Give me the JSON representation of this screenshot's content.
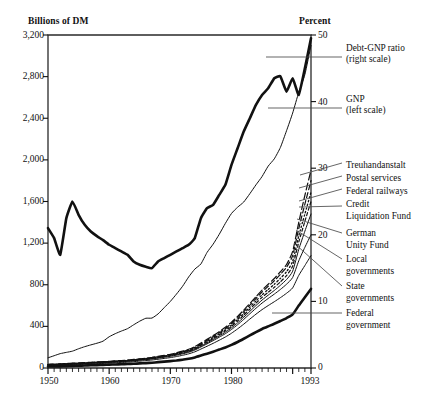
{
  "chart_data": {
    "type": "line",
    "title": "",
    "ylabel": "Billions of DM",
    "ylabel_right": "Percent",
    "xlabel": "",
    "xlim": [
      1950,
      1993
    ],
    "ylim": [
      0,
      3200
    ],
    "ylim_right": [
      0,
      50
    ],
    "grid": false,
    "legend_position": "right",
    "y_ticks": [
      "0",
      "400",
      "800",
      "1,200",
      "1,600",
      "2,000",
      "2,400",
      "2,800",
      "3,200"
    ],
    "y_tick_values": [
      0,
      400,
      800,
      1200,
      1600,
      2000,
      2400,
      2800,
      3200
    ],
    "y_ticks_right": [
      "0",
      "10",
      "20",
      "30",
      "40",
      "50"
    ],
    "y_tick_values_right": [
      0,
      10,
      20,
      30,
      40,
      50
    ],
    "x_ticks": [
      "1950",
      "1960",
      "1970",
      "1980",
      "1993"
    ],
    "x_tick_values": [
      1950,
      1960,
      1970,
      1980,
      1993
    ],
    "x_minor_tick_interval": 1,
    "x": [
      1950,
      1951,
      1952,
      1953,
      1954,
      1955,
      1956,
      1957,
      1958,
      1959,
      1960,
      1961,
      1962,
      1963,
      1964,
      1965,
      1966,
      1967,
      1968,
      1969,
      1970,
      1971,
      1972,
      1973,
      1974,
      1975,
      1976,
      1977,
      1978,
      1979,
      1980,
      1981,
      1982,
      1983,
      1984,
      1985,
      1986,
      1987,
      1988,
      1989,
      1990,
      1991,
      1992,
      1993
    ],
    "series": [
      {
        "name": "Debt-GNP ratio (right scale)",
        "axis": "right",
        "units": "percent",
        "style": "solid-thick",
        "values": [
          21.0,
          19.5,
          17.0,
          22.5,
          25.0,
          23.0,
          21.5,
          20.5,
          19.8,
          19.2,
          18.5,
          18.0,
          17.5,
          17.0,
          16.0,
          15.5,
          15.2,
          15.0,
          16.0,
          16.5,
          17.0,
          17.5,
          18.0,
          18.5,
          19.5,
          22.5,
          24.0,
          24.5,
          26.0,
          27.5,
          30.5,
          33.0,
          35.5,
          37.5,
          39.5,
          41.0,
          42.0,
          43.5,
          43.8,
          41.5,
          43.5,
          41.0,
          45.0,
          49.5
        ]
      },
      {
        "name": "GNP (left scale)",
        "axis": "left",
        "units": "billions_dm",
        "style": "solid-thin",
        "values": [
          98,
          118,
          138,
          150,
          162,
          185,
          205,
          222,
          238,
          258,
          300,
          330,
          355,
          378,
          415,
          450,
          478,
          480,
          520,
          580,
          640,
          710,
          785,
          875,
          950,
          1000,
          1110,
          1190,
          1285,
          1390,
          1485,
          1545,
          1595,
          1675,
          1760,
          1840,
          1940,
          2010,
          2120,
          2280,
          2450,
          2650,
          2820,
          3100
        ]
      },
      {
        "name": "Treuhandanstalt",
        "axis": "left",
        "units": "billions_dm",
        "style": "dashed-long",
        "values": [
          35,
          38,
          40,
          43,
          46,
          49,
          52,
          55,
          58,
          61,
          64,
          68,
          72,
          76,
          82,
          88,
          94,
          102,
          112,
          122,
          132,
          146,
          162,
          180,
          205,
          240,
          275,
          312,
          350,
          392,
          440,
          496,
          556,
          620,
          685,
          748,
          805,
          860,
          925,
          995,
          1120,
          1400,
          1660,
          1900
        ]
      },
      {
        "name": "Postal services",
        "axis": "left",
        "units": "billions_dm",
        "style": "dashed-medium",
        "values": [
          33,
          36,
          38,
          41,
          44,
          47,
          50,
          53,
          56,
          59,
          62,
          66,
          70,
          74,
          79,
          85,
          91,
          99,
          108,
          118,
          128,
          141,
          157,
          174,
          198,
          232,
          266,
          302,
          339,
          380,
          427,
          482,
          541,
          604,
          668,
          730,
          785,
          838,
          900,
          968,
          1080,
          1340,
          1575,
          1800
        ]
      },
      {
        "name": "Federal railways",
        "axis": "left",
        "units": "billions_dm",
        "style": "dotted",
        "values": [
          31,
          34,
          36,
          39,
          42,
          45,
          48,
          51,
          54,
          57,
          60,
          64,
          68,
          72,
          77,
          83,
          89,
          96,
          105,
          115,
          125,
          137,
          152,
          169,
          192,
          225,
          258,
          293,
          329,
          368,
          413,
          466,
          523,
          584,
          645,
          703,
          755,
          805,
          862,
          925,
          1025,
          1270,
          1480,
          1690
        ]
      },
      {
        "name": "Credit Liquidation Fund",
        "axis": "left",
        "units": "billions_dm",
        "style": "dashed-short",
        "values": [
          29,
          32,
          34,
          37,
          40,
          43,
          46,
          49,
          52,
          55,
          58,
          62,
          66,
          70,
          75,
          81,
          87,
          94,
          102,
          112,
          121,
          133,
          147,
          163,
          186,
          218,
          250,
          284,
          319,
          357,
          400,
          451,
          506,
          565,
          623,
          679,
          728,
          775,
          828,
          888,
          980,
          1210,
          1410,
          1600
        ]
      },
      {
        "name": "German Unity Fund",
        "axis": "left",
        "units": "billions_dm",
        "style": "solid-thin",
        "values": [
          28,
          30,
          32,
          35,
          38,
          41,
          44,
          47,
          50,
          53,
          56,
          60,
          63,
          67,
          72,
          78,
          84,
          91,
          99,
          108,
          117,
          128,
          142,
          157,
          179,
          210,
          241,
          274,
          308,
          344,
          385,
          434,
          487,
          544,
          600,
          653,
          700,
          745,
          795,
          850,
          930,
          1140,
          1315,
          1480
        ]
      },
      {
        "name": "Local governments",
        "axis": "left",
        "units": "billions_dm",
        "style": "solid-thin",
        "values": [
          26,
          28,
          30,
          33,
          36,
          39,
          42,
          45,
          48,
          51,
          54,
          57,
          60,
          64,
          69,
          75,
          80,
          87,
          95,
          103,
          112,
          123,
          136,
          151,
          172,
          202,
          232,
          263,
          296,
          330,
          370,
          416,
          467,
          521,
          574,
          624,
          668,
          710,
          755,
          805,
          870,
          1030,
          1160,
          1280
        ]
      },
      {
        "name": "State governments",
        "axis": "left",
        "units": "billions_dm",
        "style": "solid-thin",
        "values": [
          22,
          24,
          26,
          28,
          31,
          33,
          36,
          38,
          41,
          44,
          47,
          50,
          53,
          56,
          61,
          66,
          71,
          77,
          84,
          92,
          100,
          110,
          122,
          136,
          155,
          182,
          209,
          237,
          267,
          298,
          334,
          376,
          421,
          470,
          517,
          561,
          600,
          637,
          676,
          718,
          770,
          890,
          985,
          1080
        ]
      },
      {
        "name": "Federal government",
        "axis": "left",
        "units": "billions_dm",
        "style": "solid-thick",
        "values": [
          14,
          15,
          16,
          18,
          20,
          22,
          24,
          26,
          28,
          30,
          32,
          34,
          36,
          38,
          41,
          44,
          47,
          51,
          56,
          61,
          66,
          72,
          80,
          89,
          102,
          120,
          138,
          157,
          177,
          197,
          222,
          250,
          281,
          313,
          345,
          375,
          400,
          425,
          452,
          480,
          515,
          600,
          680,
          760
        ]
      }
    ],
    "annotations": [
      {
        "text": "Debt-GNP ratio",
        "subtext": "(right scale)"
      },
      {
        "text": "GNP",
        "subtext": "(left scale)"
      }
    ]
  },
  "axes": {
    "left_title": "Billions of DM",
    "right_title": "Percent",
    "left_ticks": [
      {
        "label": "3,200",
        "value": 3200
      },
      {
        "label": "2,800",
        "value": 2800
      },
      {
        "label": "2,400",
        "value": 2400
      },
      {
        "label": "2,000",
        "value": 2000
      },
      {
        "label": "1,600",
        "value": 1600
      },
      {
        "label": "1,200",
        "value": 1200
      },
      {
        "label": "800",
        "value": 800
      },
      {
        "label": "400",
        "value": 400
      },
      {
        "label": "0",
        "value": 0
      }
    ],
    "right_ticks": [
      {
        "label": "50",
        "value": 50
      },
      {
        "label": "40",
        "value": 40
      },
      {
        "label": "30",
        "value": 30
      },
      {
        "label": "20",
        "value": 20
      },
      {
        "label": "10",
        "value": 10
      },
      {
        "label": "0",
        "value": 0
      }
    ],
    "x_ticks": [
      {
        "label": "1950",
        "value": 1950
      },
      {
        "label": "1960",
        "value": 1960
      },
      {
        "label": "1970",
        "value": 1970
      },
      {
        "label": "1980",
        "value": 1980
      },
      {
        "label": "1993",
        "value": 1993
      }
    ]
  },
  "legend": {
    "top": [
      {
        "line1": "Debt-GNP ratio",
        "line2": "(right scale)"
      },
      {
        "line1": "GNP",
        "line2": "(left scale)"
      }
    ],
    "components": [
      {
        "line1": "Treuhandanstalt",
        "line2": ""
      },
      {
        "line1": "Postal services",
        "line2": ""
      },
      {
        "line1": "Federal railways",
        "line2": ""
      },
      {
        "line1": "Credit",
        "line2": "Liquidation Fund"
      },
      {
        "line1": "German",
        "line2": "Unity Fund"
      },
      {
        "line1": "Local",
        "line2": "governments"
      },
      {
        "line1": "State",
        "line2": "governments"
      },
      {
        "line1": "Federal",
        "line2": "government"
      }
    ]
  },
  "colors": {
    "ink": "#111111",
    "background": "#ffffff",
    "frame": "#2a2a2a"
  }
}
